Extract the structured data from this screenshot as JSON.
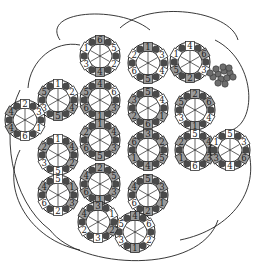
{
  "diagram": {
    "title": "",
    "colors": {
      "stroke": "#222222",
      "light_tile": "#ffffff",
      "mid_tile": "#9a9a9a",
      "dark_wedge": "#4a4a4a",
      "grape": "#6e6e6e",
      "background": "#ffffff"
    },
    "tile_radius": 20,
    "rings": [
      {
        "id": "r1",
        "cx": 100,
        "cy": 56,
        "labels": [
          "6",
          "5",
          "2",
          "4",
          "3",
          "1"
        ],
        "shade": [
          1,
          0,
          0,
          1,
          0,
          0
        ]
      },
      {
        "id": "r2",
        "cx": 148,
        "cy": 63,
        "labels": [
          "1",
          "3",
          "4",
          "5",
          "6",
          "2"
        ],
        "shade": [
          1,
          0,
          0,
          1,
          0,
          0
        ]
      },
      {
        "id": "r3",
        "cx": 190,
        "cy": 62,
        "labels": [
          "4",
          "6",
          "3",
          "2",
          "5",
          "1"
        ],
        "shade": [
          0,
          1,
          0,
          1,
          1,
          0
        ]
      },
      {
        "id": "r4",
        "cx": 58,
        "cy": 100,
        "labels": [
          "1",
          "2",
          "4",
          "5",
          "3",
          "5"
        ],
        "shade": [
          0,
          0,
          1,
          1,
          0,
          1
        ]
      },
      {
        "id": "r5",
        "cx": 100,
        "cy": 100,
        "labels": [
          "4",
          "6",
          "3",
          "1",
          "6",
          "5"
        ],
        "shade": [
          1,
          0,
          1,
          1,
          1,
          1
        ]
      },
      {
        "id": "r6",
        "cx": 148,
        "cy": 108,
        "labels": [
          "5",
          "4",
          "1",
          "6",
          "2",
          "3"
        ],
        "shade": [
          1,
          0,
          1,
          1,
          1,
          1
        ]
      },
      {
        "id": "r7",
        "cx": 195,
        "cy": 110,
        "labels": [
          "2",
          "6",
          "4",
          "1",
          "3",
          "5"
        ],
        "shade": [
          1,
          1,
          0,
          1,
          0,
          1
        ]
      },
      {
        "id": "r8",
        "cx": 25,
        "cy": 120,
        "labels": [
          "2",
          "3",
          "1",
          "6",
          "4",
          "4"
        ],
        "shade": [
          0,
          0,
          0,
          0,
          1,
          1
        ]
      },
      {
        "id": "r9",
        "cx": 100,
        "cy": 140,
        "labels": [
          "1",
          "4",
          "3",
          "5",
          "6",
          "2"
        ],
        "shade": [
          1,
          1,
          1,
          1,
          1,
          1
        ]
      },
      {
        "id": "r10",
        "cx": 148,
        "cy": 150,
        "labels": [
          "3",
          "2",
          "5",
          "4",
          "1",
          "6"
        ],
        "shade": [
          1,
          1,
          1,
          1,
          1,
          1
        ]
      },
      {
        "id": "r11",
        "cx": 195,
        "cy": 150,
        "labels": [
          "5",
          "4",
          "3",
          "6",
          "1",
          "2"
        ],
        "shade": [
          0,
          1,
          1,
          0,
          1,
          1
        ]
      },
      {
        "id": "r12",
        "cx": 230,
        "cy": 150,
        "labels": [
          "5",
          "3",
          "6",
          "4",
          "3",
          "1"
        ],
        "shade": [
          0,
          0,
          1,
          0,
          1,
          0
        ]
      },
      {
        "id": "r13",
        "cx": 58,
        "cy": 155,
        "labels": [
          "1",
          "4",
          "2",
          "5",
          "3",
          "2"
        ],
        "shade": [
          0,
          1,
          1,
          0,
          0,
          1
        ]
      },
      {
        "id": "r14",
        "cx": 100,
        "cy": 184,
        "labels": [
          "2",
          "5",
          "3",
          "1",
          "6",
          "4"
        ],
        "shade": [
          1,
          1,
          1,
          1,
          1,
          1
        ]
      },
      {
        "id": "r15",
        "cx": 148,
        "cy": 195,
        "labels": [
          "5",
          "3",
          "1",
          "2",
          "6",
          "4"
        ],
        "shade": [
          1,
          1,
          1,
          1,
          0,
          1
        ]
      },
      {
        "id": "r16",
        "cx": 58,
        "cy": 195,
        "labels": [
          "5",
          "1",
          "3",
          "2",
          "6",
          "4"
        ],
        "shade": [
          0,
          1,
          1,
          0,
          0,
          1
        ]
      },
      {
        "id": "r17",
        "cx": 135,
        "cy": 232,
        "labels": [
          "4",
          "6",
          "2",
          "1",
          "3",
          "5"
        ],
        "shade": [
          1,
          0,
          0,
          1,
          0,
          0
        ]
      },
      {
        "id": "r18",
        "cx": 98,
        "cy": 222,
        "labels": [
          "3",
          "1",
          "2",
          "3",
          "2",
          "4"
        ],
        "shade": [
          1,
          0,
          1,
          0,
          0,
          1
        ]
      }
    ],
    "grapes": {
      "cx": 218,
      "cy": 74
    },
    "outer_arcs": [
      "M 60 40 C 40 10, 120 5, 150 30",
      "M 120 28 C 150 0, 230 10, 238 40",
      "M 215 40 C 255 60, 258 120, 232 130",
      "M 245 140 C 265 190, 230 230, 180 240",
      "M 20 90 C 0 130, 10 200, 50 230",
      "M 50 230 C 80 270, 200 275, 218 220",
      "M 20 150 C 0 190, 30 240, 80 250",
      "M 28 88 C 30 60, 55 40, 80 45"
    ]
  }
}
